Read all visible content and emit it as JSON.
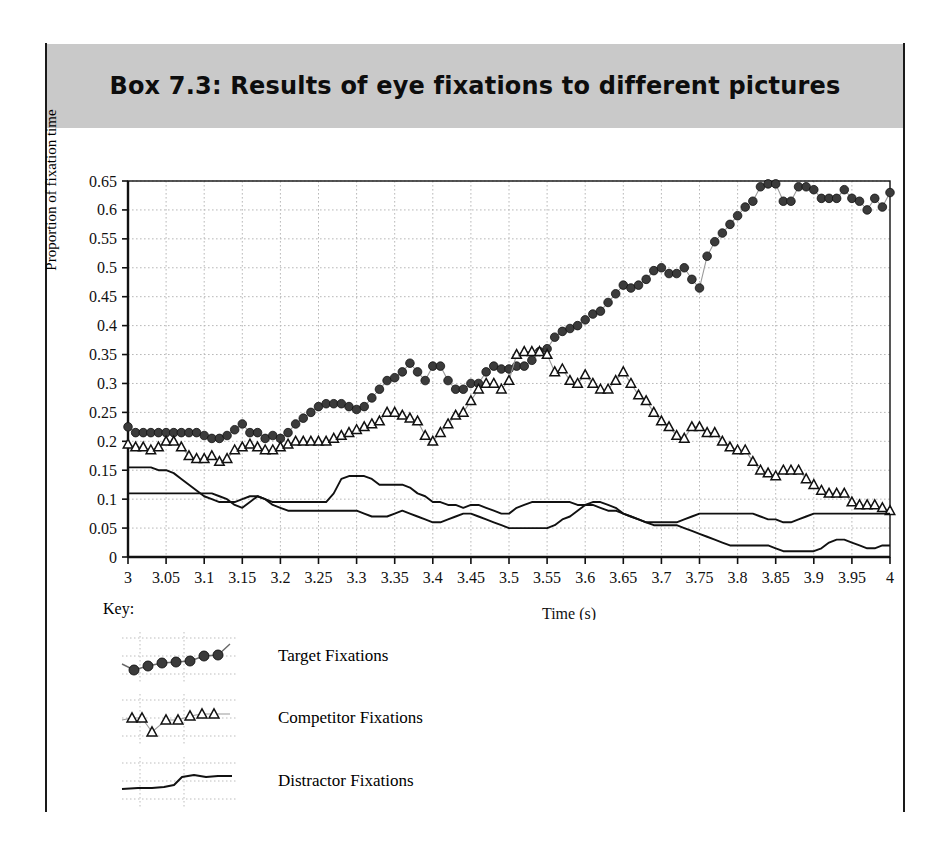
{
  "box": {
    "title": "Box 7.3:  Results of eye fixations to different pictures",
    "band_color": "#c9c9c9",
    "rule_color": "#1a1a1a"
  },
  "legend": {
    "key_label": "Key:",
    "items": [
      {
        "name": "target",
        "label": "Target Fixations",
        "marker": "filled-circle",
        "color": "#3b3b3b"
      },
      {
        "name": "competitor",
        "label": "Competitor Fixations",
        "marker": "open-triangle",
        "color": "#111111"
      },
      {
        "name": "distractor",
        "label": "Distractor Fixations",
        "marker": "plain-line",
        "color": "#111111"
      }
    ]
  },
  "chart_data": {
    "type": "line",
    "title": "Box 7.3:  Results of eye fixations to different pictures",
    "xlabel": "Time (s)",
    "ylabel": "Proportion of fixation time",
    "xlim": [
      3,
      4
    ],
    "ylim": [
      0,
      0.65
    ],
    "grid": true,
    "legend_position": "below-left",
    "xticks": [
      "3",
      "3.05",
      "3.1",
      "3.15",
      "3.2",
      "3.25",
      "3.3",
      "3.35",
      "3.4",
      "3.45",
      "3.5",
      "3.55",
      "3.6",
      "3.65",
      "3.7",
      "3.75",
      "3.8",
      "3.85",
      "3.9",
      "3.95",
      "4"
    ],
    "yticks": [
      "0",
      "0.05",
      "0.1",
      "0.15",
      "0.2",
      "0.25",
      "0.3",
      "0.35",
      "0.4",
      "0.45",
      "0.5",
      "0.55",
      "0.6",
      "0.65"
    ],
    "x": [
      3.0,
      3.01,
      3.02,
      3.03,
      3.04,
      3.05,
      3.06,
      3.07,
      3.08,
      3.09,
      3.1,
      3.11,
      3.12,
      3.13,
      3.14,
      3.15,
      3.16,
      3.17,
      3.18,
      3.19,
      3.2,
      3.21,
      3.22,
      3.23,
      3.24,
      3.25,
      3.26,
      3.27,
      3.28,
      3.29,
      3.3,
      3.31,
      3.32,
      3.33,
      3.34,
      3.35,
      3.36,
      3.37,
      3.38,
      3.39,
      3.4,
      3.41,
      3.42,
      3.43,
      3.44,
      3.45,
      3.46,
      3.47,
      3.48,
      3.49,
      3.5,
      3.51,
      3.52,
      3.53,
      3.54,
      3.55,
      3.56,
      3.57,
      3.58,
      3.59,
      3.6,
      3.61,
      3.62,
      3.63,
      3.64,
      3.65,
      3.66,
      3.67,
      3.68,
      3.69,
      3.7,
      3.71,
      3.72,
      3.73,
      3.74,
      3.75,
      3.76,
      3.77,
      3.78,
      3.79,
      3.8,
      3.81,
      3.82,
      3.83,
      3.84,
      3.85,
      3.86,
      3.87,
      3.88,
      3.89,
      3.9,
      3.91,
      3.92,
      3.93,
      3.94,
      3.95,
      3.96,
      3.97,
      3.98,
      3.99,
      4.0
    ],
    "series": [
      {
        "name": "Target Fixations",
        "marker": "filled-circle",
        "color": "#3b3b3b",
        "values": [
          0.225,
          0.215,
          0.215,
          0.215,
          0.215,
          0.215,
          0.215,
          0.215,
          0.215,
          0.215,
          0.21,
          0.205,
          0.205,
          0.21,
          0.22,
          0.23,
          0.215,
          0.215,
          0.205,
          0.21,
          0.205,
          0.215,
          0.23,
          0.24,
          0.25,
          0.26,
          0.265,
          0.265,
          0.265,
          0.26,
          0.255,
          0.26,
          0.275,
          0.29,
          0.305,
          0.31,
          0.32,
          0.335,
          0.32,
          0.305,
          0.33,
          0.33,
          0.305,
          0.29,
          0.29,
          0.3,
          0.3,
          0.32,
          0.33,
          0.325,
          0.325,
          0.33,
          0.33,
          0.34,
          0.355,
          0.36,
          0.38,
          0.39,
          0.395,
          0.4,
          0.41,
          0.42,
          0.425,
          0.44,
          0.455,
          0.47,
          0.465,
          0.47,
          0.48,
          0.495,
          0.5,
          0.49,
          0.49,
          0.5,
          0.48,
          0.465,
          0.52,
          0.545,
          0.56,
          0.575,
          0.59,
          0.605,
          0.615,
          0.64,
          0.645,
          0.645,
          0.615,
          0.615,
          0.64,
          0.64,
          0.635,
          0.62,
          0.62,
          0.62,
          0.635,
          0.62,
          0.615,
          0.6,
          0.62,
          0.605,
          0.63
        ]
      },
      {
        "name": "Competitor Fixations",
        "marker": "open-triangle",
        "color": "#111111",
        "values": [
          0.195,
          0.19,
          0.19,
          0.185,
          0.19,
          0.2,
          0.2,
          0.19,
          0.175,
          0.17,
          0.17,
          0.175,
          0.165,
          0.17,
          0.185,
          0.19,
          0.195,
          0.19,
          0.185,
          0.185,
          0.19,
          0.195,
          0.2,
          0.2,
          0.2,
          0.2,
          0.2,
          0.205,
          0.21,
          0.215,
          0.22,
          0.225,
          0.23,
          0.235,
          0.25,
          0.25,
          0.245,
          0.24,
          0.235,
          0.21,
          0.2,
          0.215,
          0.23,
          0.245,
          0.25,
          0.27,
          0.29,
          0.3,
          0.3,
          0.29,
          0.305,
          0.35,
          0.355,
          0.355,
          0.355,
          0.35,
          0.32,
          0.325,
          0.305,
          0.3,
          0.315,
          0.3,
          0.29,
          0.29,
          0.305,
          0.32,
          0.3,
          0.28,
          0.27,
          0.25,
          0.235,
          0.225,
          0.21,
          0.205,
          0.225,
          0.225,
          0.215,
          0.215,
          0.2,
          0.19,
          0.185,
          0.185,
          0.165,
          0.15,
          0.145,
          0.14,
          0.15,
          0.15,
          0.15,
          0.135,
          0.125,
          0.115,
          0.11,
          0.11,
          0.11,
          0.095,
          0.09,
          0.09,
          0.09,
          0.085,
          0.08
        ]
      },
      {
        "name": "Distractor Fixations (1)",
        "marker": "plain-line",
        "color": "#111111",
        "values": [
          0.155,
          0.155,
          0.155,
          0.155,
          0.15,
          0.15,
          0.145,
          0.135,
          0.125,
          0.115,
          0.105,
          0.1,
          0.095,
          0.095,
          0.095,
          0.1,
          0.105,
          0.105,
          0.1,
          0.095,
          0.095,
          0.095,
          0.095,
          0.095,
          0.095,
          0.095,
          0.095,
          0.11,
          0.135,
          0.14,
          0.14,
          0.14,
          0.135,
          0.125,
          0.125,
          0.125,
          0.125,
          0.12,
          0.11,
          0.105,
          0.095,
          0.095,
          0.09,
          0.09,
          0.085,
          0.09,
          0.09,
          0.085,
          0.08,
          0.075,
          0.075,
          0.085,
          0.09,
          0.095,
          0.095,
          0.095,
          0.095,
          0.095,
          0.095,
          0.09,
          0.09,
          0.09,
          0.085,
          0.08,
          0.08,
          0.075,
          0.07,
          0.065,
          0.06,
          0.06,
          0.06,
          0.06,
          0.06,
          0.065,
          0.07,
          0.075,
          0.075,
          0.075,
          0.075,
          0.075,
          0.075,
          0.075,
          0.075,
          0.07,
          0.065,
          0.065,
          0.06,
          0.06,
          0.065,
          0.07,
          0.075,
          0.075,
          0.075,
          0.075,
          0.075,
          0.075,
          0.075,
          0.075,
          0.075,
          0.075,
          0.075
        ]
      },
      {
        "name": "Distractor Fixations (2)",
        "marker": "plain-line",
        "color": "#111111",
        "values": [
          0.11,
          0.11,
          0.11,
          0.11,
          0.11,
          0.11,
          0.11,
          0.11,
          0.11,
          0.11,
          0.11,
          0.11,
          0.105,
          0.1,
          0.09,
          0.085,
          0.095,
          0.105,
          0.1,
          0.09,
          0.085,
          0.08,
          0.08,
          0.08,
          0.08,
          0.08,
          0.08,
          0.08,
          0.08,
          0.08,
          0.08,
          0.075,
          0.07,
          0.07,
          0.07,
          0.075,
          0.08,
          0.075,
          0.07,
          0.065,
          0.06,
          0.06,
          0.065,
          0.07,
          0.075,
          0.075,
          0.07,
          0.065,
          0.06,
          0.055,
          0.05,
          0.05,
          0.05,
          0.05,
          0.05,
          0.05,
          0.055,
          0.065,
          0.07,
          0.08,
          0.09,
          0.095,
          0.095,
          0.09,
          0.085,
          0.075,
          0.07,
          0.065,
          0.06,
          0.055,
          0.055,
          0.055,
          0.055,
          0.05,
          0.045,
          0.04,
          0.035,
          0.03,
          0.025,
          0.02,
          0.02,
          0.02,
          0.02,
          0.02,
          0.02,
          0.015,
          0.01,
          0.01,
          0.01,
          0.01,
          0.01,
          0.015,
          0.025,
          0.03,
          0.03,
          0.025,
          0.02,
          0.015,
          0.015,
          0.02,
          0.02
        ]
      }
    ]
  }
}
